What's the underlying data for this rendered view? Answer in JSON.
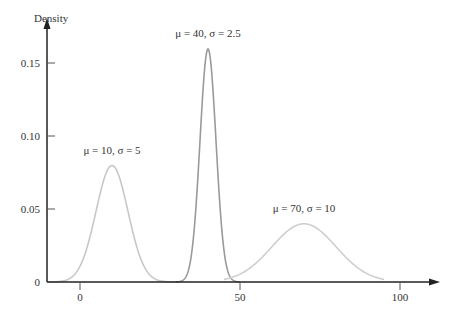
{
  "chart_data": {
    "type": "line",
    "title": "",
    "xlabel": "",
    "ylabel": "Density",
    "xlim": [
      -10,
      105
    ],
    "ylim": [
      0,
      0.17
    ],
    "x_ticks": [
      0,
      50,
      100
    ],
    "x_tick_labels": [
      "0",
      "50",
      "100"
    ],
    "y_ticks": [
      0,
      0.05,
      0.1,
      0.15
    ],
    "y_tick_labels": [
      "0",
      "0.05",
      "0.10",
      "0.15"
    ],
    "grid": false,
    "legend": "none",
    "series": [
      {
        "name": "μ = 10, σ = 5",
        "mu": 10,
        "sigma": 5,
        "x_range": [
          -10,
          30
        ],
        "peak": 0.0798,
        "color": "#c8c8c8",
        "label_x": 10,
        "label_y": 0.088
      },
      {
        "name": "μ = 40, σ = 2.5",
        "mu": 40,
        "sigma": 2.5,
        "x_range": [
          30,
          50
        ],
        "peak": 0.1596,
        "color": "#9a9a9a",
        "label_x": 40,
        "label_y": 0.168
      },
      {
        "name": "μ = 70, σ = 10",
        "mu": 70,
        "sigma": 10,
        "x_range": [
          45,
          95
        ],
        "peak": 0.0399,
        "color": "#cfcfcf",
        "label_x": 70,
        "label_y": 0.048
      }
    ],
    "annotations": [
      "μ = 10, σ = 5",
      "μ = 40, σ = 2.5",
      "μ = 70, σ = 10"
    ]
  },
  "layout": {
    "origin_px": [
      80,
      282
    ],
    "x_px_per_unit": 3.2,
    "y_px_per_unit": 1460,
    "yaxis_x_px": 47,
    "axis_color": "#222222"
  }
}
